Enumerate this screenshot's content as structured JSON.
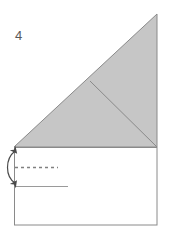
{
  "figure": {
    "step_label": "4",
    "type": "origami-fold-diagram",
    "canvas": {
      "width": 172,
      "height": 239
    }
  },
  "colors": {
    "shaded_fill": "#c6c6c6",
    "paper_fill": "#ffffff",
    "outline": "#8a8a8a",
    "fold_crease": "#8a8a8a",
    "dashed_fold_line": "#808080",
    "reference_line": "#9a9a9a",
    "arrow": "#4a4a4a",
    "label_text": "#595959",
    "background": "#ffffff"
  },
  "shapes": {
    "base_rectangle": {
      "name": "base-rectangle",
      "x": 14,
      "y": 147,
      "width": 143,
      "height": 78,
      "fill": "#ffffff",
      "stroke": "#8a8a8a"
    },
    "shaded_triangle": {
      "name": "shaded-triangle",
      "points": "14,147 157,14 157,147",
      "fill": "#c6c6c6",
      "stroke": "#8a8a8a",
      "description": "large right triangle above the rectangle, shaded gray"
    },
    "inner_crease": {
      "name": "inner-crease-line",
      "x1": 90,
      "y1": 81,
      "x2": 157,
      "y2": 147,
      "stroke": "#8a8a8a",
      "description": "crease from hypotenuse midpoint to lower-right corner"
    },
    "dashed_fold_line": {
      "name": "dashed-fold-line",
      "x1": 15,
      "y1": 167,
      "x2": 58,
      "y2": 167,
      "dash": "3 3",
      "stroke": "#808080"
    },
    "reference_line": {
      "name": "reference-line",
      "x1": 15,
      "y1": 186,
      "x2": 68,
      "y2": 186,
      "stroke": "#9a9a9a"
    },
    "fold_arrow": {
      "name": "double-headed-fold-arrow",
      "path": "M 15 150 C 4 158, 4 176, 15 184",
      "stroke": "#4a4a4a",
      "double_headed": true,
      "description": "curved double-headed arrow on the left edge indicating fold up/down"
    }
  },
  "labels": {
    "step_number": {
      "text": "4",
      "x": 15,
      "y": 40
    }
  }
}
